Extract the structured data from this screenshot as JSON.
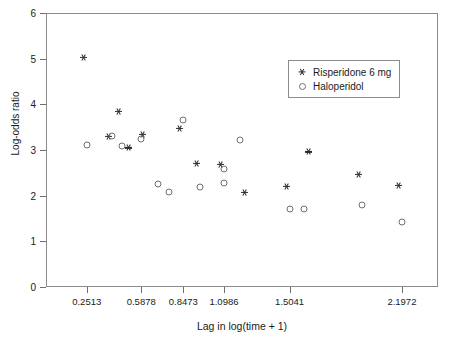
{
  "chart_data": {
    "type": "scatter",
    "title": "",
    "xlabel": "Lag in log(time + 1)",
    "ylabel": "Log-odds ratio",
    "xlim": [
      0.0,
      2.42
    ],
    "ylim": [
      0,
      6
    ],
    "grid": false,
    "legend_position": "top-right",
    "xtick_labels": [
      "0.2513",
      "0.5878",
      "0.8473",
      "1.0986",
      "1.5041",
      "2.1972"
    ],
    "xtick_values": [
      0.2513,
      0.5878,
      0.8473,
      1.0986,
      1.5041,
      2.1972
    ],
    "ytick_labels": [
      "0",
      "1",
      "2",
      "3",
      "4",
      "5",
      "6"
    ],
    "ytick_values": [
      0,
      1,
      2,
      3,
      4,
      5,
      6
    ],
    "series": [
      {
        "name": "Risperidone 6 mg",
        "marker": "asterisk",
        "color": "#2b2b2b",
        "points": [
          {
            "x": 0.2513,
            "y": 4.95
          },
          {
            "x": 0.4055,
            "y": 3.22
          },
          {
            "x": 0.47,
            "y": 3.76
          },
          {
            "x": 0.53,
            "y": 2.97
          },
          {
            "x": 0.62,
            "y": 3.27
          },
          {
            "x": 0.8473,
            "y": 3.39
          },
          {
            "x": 0.95,
            "y": 2.63
          },
          {
            "x": 1.0986,
            "y": 2.6
          },
          {
            "x": 1.25,
            "y": 2.0
          },
          {
            "x": 1.5041,
            "y": 2.13
          },
          {
            "x": 1.64,
            "y": 2.88
          },
          {
            "x": 1.95,
            "y": 2.39
          },
          {
            "x": 2.1972,
            "y": 2.14
          }
        ]
      },
      {
        "name": "Haloperidol",
        "marker": "circle",
        "color": "#6f6f6f",
        "points": [
          {
            "x": 0.2513,
            "y": 3.11
          },
          {
            "x": 0.4055,
            "y": 3.31
          },
          {
            "x": 0.47,
            "y": 3.08
          },
          {
            "x": 0.5878,
            "y": 3.24
          },
          {
            "x": 0.69,
            "y": 2.25
          },
          {
            "x": 0.76,
            "y": 2.08
          },
          {
            "x": 0.8473,
            "y": 3.65
          },
          {
            "x": 0.95,
            "y": 2.2
          },
          {
            "x": 1.0986,
            "y": 2.58
          },
          {
            "x": 1.0986,
            "y": 2.27
          },
          {
            "x": 1.2,
            "y": 3.22
          },
          {
            "x": 1.5041,
            "y": 1.71
          },
          {
            "x": 1.59,
            "y": 1.7
          },
          {
            "x": 1.95,
            "y": 1.79
          },
          {
            "x": 2.1972,
            "y": 1.42
          }
        ]
      }
    ]
  },
  "legend": {
    "items": [
      {
        "label": "Risperidone 6 mg",
        "marker": "asterisk"
      },
      {
        "label": "Haloperidol",
        "marker": "circle"
      }
    ]
  }
}
